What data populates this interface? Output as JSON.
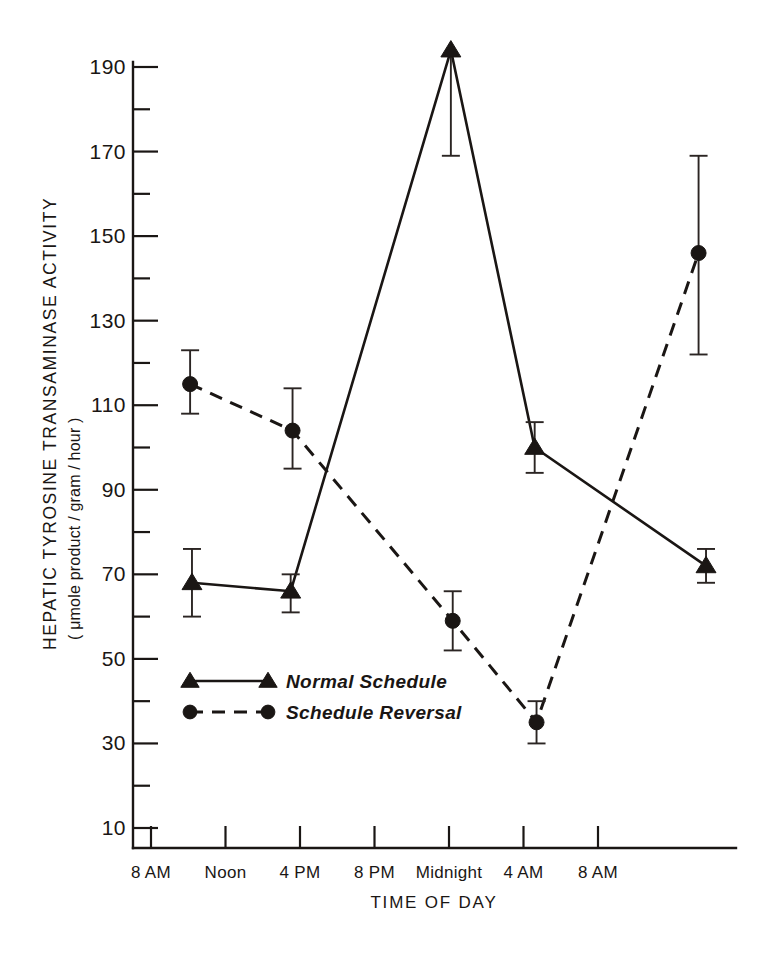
{
  "chart_data": {
    "type": "line",
    "title": "",
    "ylabel": "HEPATIC TYROSINE TRANSAMINASE ACTIVITY",
    "ylabel_units": "( μmole product / gram / hour )",
    "xlabel": "TIME OF DAY",
    "ylim": [
      0,
      200
    ],
    "y_ticks_major": [
      10,
      30,
      50,
      70,
      90,
      110,
      130,
      150,
      170,
      190
    ],
    "y_ticks_minor": [
      20,
      40,
      60,
      80,
      100,
      120,
      140,
      160,
      180
    ],
    "y_tick_labels": [
      "10",
      "30",
      "50",
      "70",
      "90",
      "110",
      "130",
      "150",
      "170",
      "190"
    ],
    "x_tick_labels": [
      "8 AM",
      "Noon",
      "4 PM",
      "8 PM",
      "Midnight",
      "4 AM",
      "8 AM"
    ],
    "x_tick_hours": [
      8,
      12,
      16,
      20,
      24,
      28,
      32
    ],
    "xlim_hours": [
      6.5,
      35.5
    ],
    "grid": false,
    "legend_position": "lower-left-inside",
    "series": [
      {
        "name": "Normal Schedule",
        "marker": "triangle",
        "linestyle": "solid",
        "x_hours": [
          10.2,
          15.5,
          24.1,
          28.6,
          37.8
        ],
        "x_labels": [
          "10 AM",
          "3:30 PM",
          "Midnight",
          "4:30 AM",
          "1:45 PM"
        ],
        "values": [
          68,
          66,
          194,
          100,
          72
        ],
        "err_low": [
          60,
          61,
          169,
          94,
          68
        ],
        "err_high": [
          76,
          70,
          194,
          106,
          76
        ]
      },
      {
        "name": "Schedule Reversal",
        "marker": "circle",
        "linestyle": "dashed",
        "x_hours": [
          10.1,
          15.6,
          24.2,
          28.7,
          37.4
        ],
        "x_labels": [
          "10 AM",
          "3:30 PM",
          "Midnight",
          "4:30 AM",
          "1:15 PM"
        ],
        "values": [
          115,
          104,
          59,
          35,
          146
        ],
        "err_low": [
          108,
          95,
          52,
          30,
          122
        ],
        "err_high": [
          123,
          114,
          66,
          40,
          169
        ]
      }
    ]
  },
  "legend": {
    "items": [
      {
        "label": "Normal Schedule",
        "marker": "triangle",
        "linestyle": "solid"
      },
      {
        "label": "Schedule Reversal",
        "marker": "circle",
        "linestyle": "dashed"
      }
    ]
  },
  "colors": {
    "ink": "#1a1614",
    "background": "#ffffff"
  }
}
